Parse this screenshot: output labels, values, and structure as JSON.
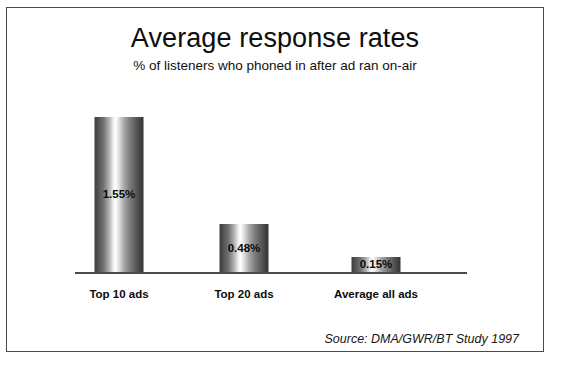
{
  "chart_data": {
    "type": "bar",
    "title": "Average response rates",
    "subtitle": "% of listeners who phoned in after ad ran on-air",
    "categories": [
      "Top 10 ads",
      "Top 20 ads",
      "Average all ads"
    ],
    "values": [
      1.55,
      0.48,
      0.15
    ],
    "value_labels": [
      "1.55%",
      "0.48%",
      "0.15%"
    ],
    "xlabel": "",
    "ylabel": "",
    "ylim": [
      0,
      1.75
    ],
    "grid": false,
    "legend": null,
    "axis": {
      "y_axis_visible": false,
      "x_axis_visible": true,
      "tick_labels_visible": false
    },
    "annotations": [
      "Source: DMA/GWR/BT Study 1997"
    ],
    "style": {
      "bar_fill": "metallic-gradient",
      "bar_dark": "#3b3b3b",
      "bar_highlight": "#ffffff",
      "axis_line_color": "#4b4b4b",
      "text_color": "#0d0d0d",
      "background": "#ffffff",
      "frame_color": "#4a4a4a"
    }
  },
  "source": {
    "text": "Source: DMA/GWR/BT Study 1997"
  }
}
